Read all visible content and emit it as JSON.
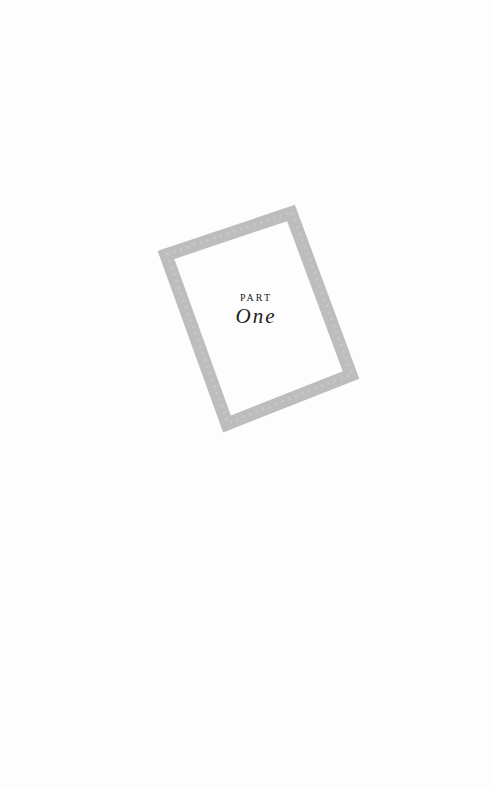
{
  "page": {
    "kicker": "PART",
    "title": "One",
    "frame_color": "#b8b8b8",
    "background": "#fdfdfd"
  }
}
